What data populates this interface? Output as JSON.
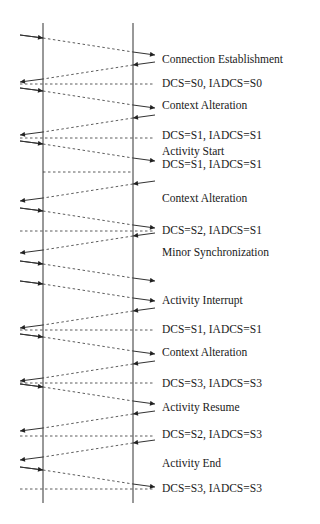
{
  "diagram": {
    "type": "sequence-timeline",
    "colors": {
      "line": "#333333",
      "text": "#1a1a1a",
      "background": "#ffffff"
    },
    "lifelines": [
      {
        "id": "left",
        "x": 43,
        "y1": 23,
        "y2": 503
      },
      {
        "id": "right",
        "x": 133,
        "y1": 23,
        "y2": 503
      }
    ],
    "labels": [
      {
        "text": "Connection Establishment",
        "y": 60
      },
      {
        "text": "DCS=S0, IADCS=S0",
        "y": 84
      },
      {
        "text": "Context Alteration",
        "y": 106
      },
      {
        "text": "DCS=S1, IADCS=S1",
        "y": 136
      },
      {
        "text": "Activity Start",
        "y": 152
      },
      {
        "text": "DCS=S1, IADCS=S1",
        "y": 165
      },
      {
        "text": "Context Alteration",
        "y": 199
      },
      {
        "text": "DCS=S2, IADCS=S1",
        "y": 231
      },
      {
        "text": "Minor Synchronization",
        "y": 253
      },
      {
        "text": "Activity Interrupt",
        "y": 301
      },
      {
        "text": "DCS=S1, IADCS=S1",
        "y": 330
      },
      {
        "text": "Context Alteration",
        "y": 353
      },
      {
        "text": "DCS=S3, IADCS=S3",
        "y": 384
      },
      {
        "text": "Activity Resume",
        "y": 408
      },
      {
        "text": "DCS=S2, IADCS=S3",
        "y": 435
      },
      {
        "text": "Activity End",
        "y": 464
      },
      {
        "text": "DCS=S3, IADCS=S3",
        "y": 489
      }
    ],
    "messages": [
      {
        "dir": "right",
        "y0": 35
      },
      {
        "dir": "left",
        "y0": 62
      },
      {
        "dir": "right",
        "y0": 88
      },
      {
        "dir": "left",
        "y0": 115
      },
      {
        "dir": "right",
        "y0": 141
      },
      {
        "dir": "left",
        "y0": 181
      },
      {
        "dir": "right",
        "y0": 208
      },
      {
        "dir": "left",
        "y0": 233
      },
      {
        "dir": "right",
        "y0": 261
      },
      {
        "dir": "right",
        "y0": 281
      },
      {
        "dir": "left",
        "y0": 308
      },
      {
        "dir": "right",
        "y0": 334
      },
      {
        "dir": "left",
        "y0": 361
      },
      {
        "dir": "right",
        "y0": 384
      },
      {
        "dir": "left",
        "y0": 411
      },
      {
        "dir": "left",
        "y0": 440
      },
      {
        "dir": "right",
        "y0": 467
      }
    ],
    "sync_lines": [
      {
        "y": 84,
        "x1": 20,
        "x2": 155
      },
      {
        "y": 138,
        "x1": 20,
        "x2": 155
      },
      {
        "y": 172,
        "x1": 43,
        "x2": 133
      },
      {
        "y": 231,
        "x1": 20,
        "x2": 155
      },
      {
        "y": 330,
        "x1": 20,
        "x2": 155
      },
      {
        "y": 383,
        "x1": 20,
        "x2": 155
      },
      {
        "y": 436,
        "x1": 20,
        "x2": 155
      },
      {
        "y": 489,
        "x1": 20,
        "x2": 155
      }
    ],
    "label_x": 162
  }
}
